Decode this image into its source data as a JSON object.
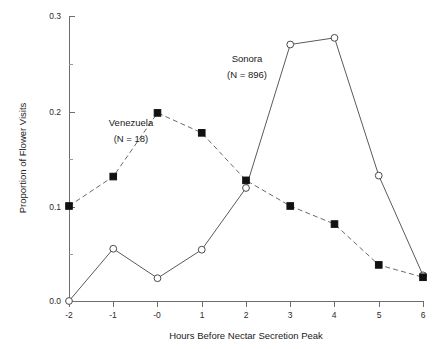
{
  "chart_data": {
    "type": "line",
    "title": "",
    "xlabel": "Hours Before Nectar Secretion Peak",
    "ylabel": "Proportion of Flower Visits",
    "x": [
      -2,
      -1,
      0,
      1,
      2,
      3,
      4,
      5,
      6
    ],
    "xtick_labels": [
      "-2",
      "-1",
      "-0",
      "1",
      "2",
      "3",
      "4",
      "5",
      "6"
    ],
    "ytick_labels": [
      "0.0",
      "0.1",
      "0.2",
      "0.3"
    ],
    "ytick_values": [
      0.0,
      0.1,
      0.2,
      0.3
    ],
    "xlim": [
      -2,
      6
    ],
    "ylim": [
      0.0,
      0.3
    ],
    "grid": false,
    "legend_position": "inline-annotation",
    "minor_ticks_y": [
      0.05,
      0.15,
      0.25
    ],
    "series": [
      {
        "name": "Venezuela",
        "annotation_label": "Venezuela",
        "annotation_n": "(N = 18)",
        "marker": "filled-square",
        "linestyle": "dashed",
        "color": "#111111",
        "values": [
          0.1,
          0.131,
          0.198,
          0.177,
          0.127,
          0.1,
          0.081,
          0.038,
          0.025
        ]
      },
      {
        "name": "Sonora",
        "annotation_label": "Sonora",
        "annotation_n": "(N = 896)",
        "marker": "open-circle",
        "linestyle": "solid",
        "color": "#4a4a4a",
        "values": [
          0.0,
          0.055,
          0.024,
          0.054,
          0.119,
          0.27,
          0.277,
          0.132,
          0.027
        ]
      }
    ]
  },
  "annotations": {
    "venezuela_label": "Venezuela",
    "venezuela_n": "(N = 18)",
    "sonora_label": "Sonora",
    "sonora_n": "(N = 896)"
  },
  "axes": {
    "x_title": "Hours Before Nectar Secretion Peak",
    "y_title": "Proportion of Flower Visits"
  }
}
